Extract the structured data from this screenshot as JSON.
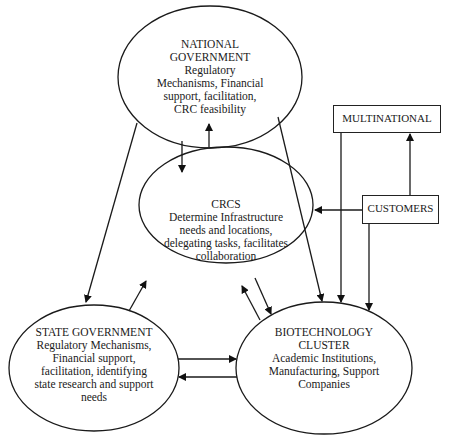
{
  "nodes": {
    "national": {
      "title_line1": "NATIONAL",
      "title_line2": "GOVERNMENT",
      "desc_lines": [
        "Regulatory",
        "Mechanisms, Financial",
        "support, facilitation,",
        "CRC feasibility"
      ]
    },
    "crcs": {
      "title": "CRCS",
      "desc_lines": [
        "Determine Infrastructure",
        "needs and locations,",
        "delegating tasks, facilitates",
        "collaboration"
      ]
    },
    "state": {
      "title": "STATE GOVERNMENT",
      "desc_lines": [
        "Regulatory Mechanisms,",
        "Financial support,",
        "facilitation, identifying",
        "state research and support",
        "needs"
      ]
    },
    "biotech": {
      "title_line1": "BIOTECHNOLOGY",
      "title_line2": "CLUSTER",
      "desc_lines": [
        "Academic Institutions,",
        "Manufacturing, Support",
        "Companies"
      ]
    },
    "multinational": {
      "label": "MULTINATIONAL"
    },
    "customers": {
      "label": "CUSTOMERS"
    }
  },
  "edges": [
    {
      "from": "National Government",
      "to": "CRCS"
    },
    {
      "from": "CRCS",
      "to": "National Government"
    },
    {
      "from": "National Government",
      "to": "State Government"
    },
    {
      "from": "National Government",
      "to": "Biotechnology Cluster"
    },
    {
      "from": "State Government",
      "to": "CRCS"
    },
    {
      "from": "CRCS",
      "to": "Biotechnology Cluster"
    },
    {
      "from": "Biotechnology Cluster",
      "to": "CRCS"
    },
    {
      "from": "State Government",
      "to": "Biotechnology Cluster"
    },
    {
      "from": "Biotechnology Cluster",
      "to": "State Government"
    },
    {
      "from": "Customers",
      "to": "CRCS"
    },
    {
      "from": "Customers",
      "to": "Multinational"
    },
    {
      "from": "Customers",
      "to": "Biotechnology Cluster"
    },
    {
      "from": "Multinational",
      "to": "Biotechnology Cluster"
    }
  ]
}
